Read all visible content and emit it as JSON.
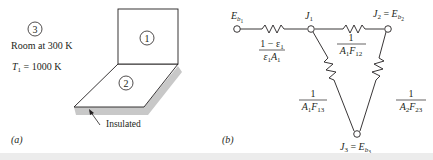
{
  "panel_a": {
    "caption": "(a)",
    "room_label_number": "3",
    "room_label": "Room at 300 K",
    "temp_label_var": "T",
    "temp_label_sub": "1",
    "temp_label_value": " = 1000 K",
    "surface_1_label": "1",
    "surface_2_label": "2",
    "insulated_label": "Insulated",
    "colors": {
      "line": "#231f20",
      "shadow": "#c8c8c8"
    }
  },
  "panel_b": {
    "caption": "(b)",
    "nodes": {
      "eb1": {
        "base": "E",
        "sub": "b",
        "subsub": "1"
      },
      "j1": {
        "base": "J",
        "sub": "1"
      },
      "j2": {
        "base": "J",
        "sub": "2",
        "eq": " = ",
        "rhs_base": "E",
        "rhs_sub": "b",
        "rhs_subsub": "2"
      },
      "j3": {
        "base": "J",
        "sub": "3",
        "eq": " = ",
        "rhs_base": "E",
        "rhs_sub": "b",
        "rhs_subsub": "3"
      }
    },
    "resistors": {
      "surface_1": {
        "numerator": "1 − ε",
        "numerator_sub": "1",
        "denominator_a": "ε",
        "denominator_a_sub": "1",
        "denominator_b": "A",
        "denominator_b_sub": "1"
      },
      "space_12": {
        "numerator": "1",
        "denominator_a": "A",
        "denominator_a_sub": "1",
        "denominator_b": "F",
        "denominator_b_sub": "12"
      },
      "space_13": {
        "numerator": "1",
        "denominator_a": "A",
        "denominator_a_sub": "1",
        "denominator_b": "F",
        "denominator_b_sub": "13"
      },
      "space_23": {
        "numerator": "1",
        "denominator_a": "A",
        "denominator_a_sub": "2",
        "denominator_b": "F",
        "denominator_b_sub": "23"
      }
    }
  }
}
